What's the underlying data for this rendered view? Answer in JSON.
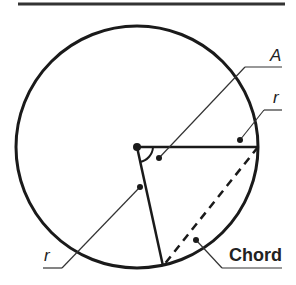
{
  "diagram": {
    "labels": {
      "angle": "A",
      "radius_top": "r",
      "radius_bottom": "r",
      "chord": "Chord"
    },
    "colors": {
      "stroke": "#1a1a1a",
      "leader": "#333333",
      "background": "#ffffff"
    },
    "geometry": {
      "center": [
        137,
        147
      ],
      "radius": 121,
      "radius_end_right": [
        258,
        147
      ],
      "radius_end_bottom": [
        162,
        266
      ]
    }
  }
}
